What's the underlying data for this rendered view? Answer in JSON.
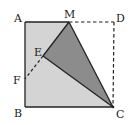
{
  "figure": {
    "type": "geometry",
    "colors": {
      "light_fill": "#d4d4d4",
      "dark_fill": "#8c8c8c",
      "stroke": "#222222",
      "background": "#ffffff"
    },
    "points": {
      "A": {
        "label": "A",
        "x": 25,
        "y": 22
      },
      "M": {
        "label": "M",
        "x": 69,
        "y": 22
      },
      "D": {
        "label": "D",
        "x": 114,
        "y": 22
      },
      "E": {
        "label": "E",
        "x": 43,
        "y": 56
      },
      "F": {
        "label": "F",
        "x": 25,
        "y": 79
      },
      "B": {
        "label": "B",
        "x": 25,
        "y": 107
      },
      "C": {
        "label": "C",
        "x": 113,
        "y": 107
      }
    },
    "solid_segments": [
      "AM",
      "AB",
      "BC",
      "MC",
      "ME",
      "EC"
    ],
    "dashed_segments": [
      "MD",
      "DC",
      "EF"
    ],
    "regions": [
      {
        "name": "light-region",
        "vertices": [
          "A",
          "M",
          "E",
          "C",
          "B"
        ]
      },
      {
        "name": "dark-triangle",
        "vertices": [
          "M",
          "E",
          "C"
        ]
      }
    ]
  }
}
